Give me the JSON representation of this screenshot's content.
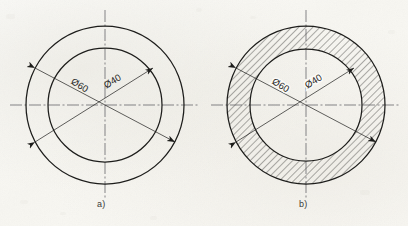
{
  "document": {
    "type": "engineering-drawing",
    "subject": "Concentric annular ring (washer) — two representations",
    "background_color": "#fbfaf7",
    "line_color": "#1d1d1b",
    "centerline_color": "#55555a",
    "hatch_color": "#2a2a28"
  },
  "figures": [
    {
      "id": "a",
      "caption": "a)",
      "caption_x": 103,
      "caption_y": 205,
      "center_x": 105,
      "center_y": 105,
      "outer_radius": 79,
      "inner_radius": 57,
      "hatched": false,
      "hatch_label": "no-section-hatching",
      "dimensions": [
        {
          "name": "outer-diameter",
          "label": "Ø60",
          "value": 60,
          "symbol": "Ø",
          "text_x": 78,
          "text_y": 88,
          "rotation": 31,
          "angle_deg": 208,
          "from_x": 35,
          "from_y": 68,
          "to_x": 175,
          "to_y": 142
        },
        {
          "name": "inner-diameter",
          "label": "Ø40",
          "value": 40,
          "symbol": "Ø",
          "text_x": 114,
          "text_y": 84,
          "rotation": -31,
          "angle_deg": 332,
          "from_x": 35,
          "from_y": 142,
          "to_x": 153,
          "to_y": 68
        }
      ]
    },
    {
      "id": "b",
      "caption": "b)",
      "caption_x": 305,
      "caption_y": 205,
      "center_x": 306,
      "center_y": 105,
      "outer_radius": 79,
      "inner_radius": 56,
      "hatched": true,
      "hatch_label": "section-hatching-45deg",
      "hatch_angle_deg": 45,
      "hatch_spacing": 5,
      "dimensions": [
        {
          "name": "outer-diameter",
          "label": "Ø60",
          "value": 60,
          "symbol": "Ø",
          "text_x": 279,
          "text_y": 88,
          "rotation": 31,
          "angle_deg": 208,
          "from_x": 236,
          "from_y": 68,
          "to_x": 376,
          "to_y": 142
        },
        {
          "name": "inner-diameter",
          "label": "Ø40",
          "value": 40,
          "symbol": "Ø",
          "text_x": 315,
          "text_y": 84,
          "rotation": -31,
          "angle_deg": 332,
          "from_x": 236,
          "from_y": 142,
          "to_x": 354,
          "to_y": 68
        }
      ]
    }
  ]
}
